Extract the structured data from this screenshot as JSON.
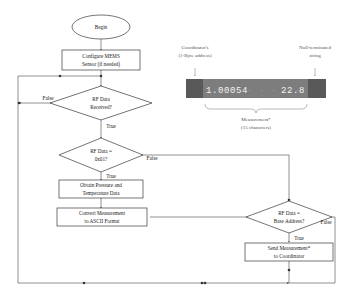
{
  "diagram": {
    "nodes": {
      "begin": {
        "label": "Begin",
        "shape": "terminator"
      },
      "configure": {
        "line1": "Configure MEMS",
        "line2": "Sensor (if needed)",
        "shape": "process"
      },
      "rf_received": {
        "line1": "RF Data",
        "line2": "Received?",
        "shape": "decision"
      },
      "rf_is_01": {
        "line1": "RF Data =",
        "line2": "0x01?",
        "shape": "decision"
      },
      "obtain": {
        "line1": "Obtain Pressure and",
        "line2": "Temperature Data",
        "shape": "process"
      },
      "convert": {
        "line1": "Convert Measurement",
        "line2": "to ASCII Format",
        "shape": "process"
      },
      "rf_base_addr": {
        "line1": "RF Data =",
        "line2": "Base Address?",
        "shape": "decision"
      },
      "send": {
        "line1": "Send Measurement*",
        "line2": "to Coordinator",
        "shape": "process"
      }
    },
    "edge_labels": {
      "received_false": "False",
      "received_true": "True",
      "is01_true": "True",
      "is01_false": "False",
      "base_true": "True",
      "base_false": "False"
    }
  },
  "packet": {
    "label_left_line1": "Coordinator's",
    "label_left_line2": "(1-Byte address)",
    "label_right_line1": "Null-terminated",
    "label_right_line2": "string",
    "caption_line1": "Measurement*",
    "caption_line2": "(15 characters)",
    "string_visible": "1.00054",
    "string_padding": "       ",
    "string_tail": "22.8",
    "char_count": "15"
  },
  "colors": {
    "shape_stroke": "#3a3a3a",
    "connector": "#555555",
    "annotation_text": "#555555",
    "packet_frame": "#6f6f6f",
    "packet_byte": "#595959",
    "packet_text": "#f2f2f2",
    "background": "#ffffff"
  }
}
